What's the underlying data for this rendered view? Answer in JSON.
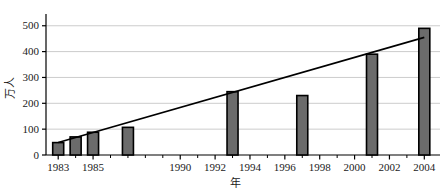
{
  "chart_data": {
    "type": "bar",
    "title": "",
    "xlabel": "年",
    "ylabel": "万人",
    "x": [
      1983,
      1984,
      1985,
      1987,
      1993,
      1997,
      2001,
      2004
    ],
    "values": [
      48,
      70,
      88,
      107,
      245,
      230,
      390,
      490
    ],
    "categories": [
      "1983",
      "1984",
      "1985",
      "1987",
      "1993",
      "1997",
      "2001",
      "2004"
    ],
    "series": [
      {
        "name": "万人",
        "type": "bar",
        "values": [
          48,
          70,
          88,
          107,
          245,
          230,
          390,
          490
        ]
      },
      {
        "name": "trend",
        "type": "line",
        "points": [
          [
            1983,
            48
          ],
          [
            2004,
            455
          ]
        ]
      }
    ],
    "xlim": [
      1982.3,
      2004.9
    ],
    "ylim": [
      0,
      530
    ],
    "x_ticks": [
      1983,
      1985,
      1990,
      1992,
      1994,
      1996,
      1998,
      2000,
      2002,
      2004
    ],
    "x_tick_labels": [
      "1983",
      "1985",
      "1990",
      "1992",
      "1994",
      "1996",
      "1998",
      "2000",
      "2002",
      "2004"
    ],
    "x_minor_ticks": [
      1984,
      1986,
      1987,
      1988,
      1989,
      1991,
      1993,
      1995,
      1997,
      1999,
      2001,
      2003
    ],
    "y_ticks": [
      0,
      100,
      200,
      300,
      400,
      500
    ],
    "y_tick_labels": [
      "0",
      "100",
      "200",
      "300",
      "400",
      "500"
    ],
    "grid": "horizontal",
    "legend": "none",
    "colors": {
      "bar_fill": "#6b6b6b",
      "bar_edge": "#000000",
      "gridline": "#cccccc",
      "axis": "#000000",
      "trendline": "#000000",
      "background": "#ffffff"
    }
  }
}
